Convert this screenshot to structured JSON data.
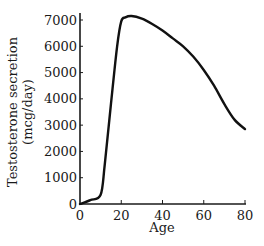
{
  "chart_data": {
    "type": "line",
    "title": "",
    "xlabel": "Age",
    "ylabel": "Testosterone secretion (mcg/day)",
    "ylabel_lines": [
      "Testosterone secretion",
      "(mcg/day)"
    ],
    "xlim": [
      0,
      80
    ],
    "ylim": [
      0,
      7000
    ],
    "x_ticks": [
      0,
      20,
      40,
      60,
      80
    ],
    "y_ticks": [
      0,
      1000,
      2000,
      3000,
      4000,
      5000,
      6000,
      7000
    ],
    "grid": false,
    "legend": null,
    "series": [
      {
        "name": "Testosterone secretion",
        "x": [
          0,
          5,
          10,
          12,
          15,
          18,
          20,
          22,
          25,
          30,
          35,
          40,
          45,
          50,
          55,
          60,
          65,
          70,
          75,
          80
        ],
        "y": [
          0,
          150,
          350,
          1500,
          3800,
          6000,
          6950,
          7100,
          7150,
          7050,
          6850,
          6600,
          6300,
          6000,
          5600,
          5100,
          4500,
          3800,
          3200,
          2850
        ]
      }
    ],
    "colors": {
      "line": "#111111",
      "axis": "#1a1a1a"
    }
  }
}
